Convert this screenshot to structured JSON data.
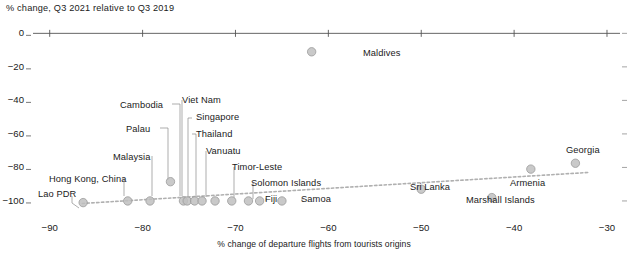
{
  "chart_data": {
    "type": "scatter",
    "title": "",
    "ylabel": "% change, Q3 2021 relative to Q3 2019",
    "xlabel": "% change of departure flights from tourists origins",
    "xlim": [
      -92,
      -28
    ],
    "ylim": [
      -106,
      2
    ],
    "xticks": [
      -90,
      -80,
      -70,
      -60,
      -50,
      -40,
      -30
    ],
    "xtick_labels": [
      "−90",
      "−80",
      "−70",
      "−60",
      "−50",
      "−40",
      "−30"
    ],
    "yticks": [
      0,
      -20,
      -40,
      -60,
      -80,
      -100
    ],
    "ytick_labels": [
      "0",
      "−20",
      "−40",
      "−60",
      "−80",
      "−100"
    ],
    "grid": false,
    "legend": null,
    "marker_color": "#c0c0c0",
    "marker_edge_color": "#9a9a9a",
    "trendline": {
      "style": "dotted",
      "color": "#b0b0b0",
      "x0": -86.5,
      "y0": -101.5,
      "x1": -32.0,
      "y1": -83.0
    },
    "points": [
      {
        "name": "Lao PDR",
        "x": -86.4,
        "y": -101.0,
        "label_x": 38,
        "label_y": 189,
        "leader": [
          [
            72,
            196
          ],
          [
            72,
            203
          ],
          [
            79,
            208
          ]
        ]
      },
      {
        "name": "Hong Kong, China",
        "x": -81.6,
        "y": -100.0,
        "label_x": 49,
        "label_y": 174,
        "leader": [
          [
            124,
            178
          ],
          [
            124,
            196
          ]
        ]
      },
      {
        "name": "Malaysia",
        "x": -79.2,
        "y": -100.0,
        "label_x": 113,
        "label_y": 152,
        "leader": [
          [
            152,
            156
          ],
          [
            152,
            196
          ]
        ]
      },
      {
        "name": "Palau",
        "x": -77.0,
        "y": -88.5,
        "label_x": 126,
        "label_y": 124,
        "leader": [
          [
            160,
            128
          ],
          [
            168,
            128
          ],
          [
            168,
            180
          ]
        ]
      },
      {
        "name": "Cambodia",
        "x": -75.6,
        "y": -100.0,
        "label_x": 120,
        "label_y": 100,
        "leader": [
          [
            172,
            104
          ],
          [
            180,
            104
          ],
          [
            180,
            196
          ]
        ]
      },
      {
        "name": "Viet Nam",
        "x": -75.2,
        "y": -100.0,
        "label_x": 182,
        "label_y": 95,
        "leader": [
          [
            182,
            100
          ],
          [
            182,
            196
          ]
        ]
      },
      {
        "name": "Singapore",
        "x": -74.4,
        "y": -100.0,
        "label_x": 196,
        "label_y": 112,
        "leader": [
          [
            192,
            118
          ],
          [
            188,
            118
          ],
          [
            188,
            196
          ]
        ]
      },
      {
        "name": "Thailand",
        "x": -73.6,
        "y": -100.0,
        "label_x": 196,
        "label_y": 129,
        "leader": [
          [
            192,
            134
          ],
          [
            196,
            134
          ],
          [
            196,
            197
          ]
        ]
      },
      {
        "name": "Vanuatu",
        "x": -72.2,
        "y": -100.0,
        "label_x": 206,
        "label_y": 146,
        "leader": [
          [
            206,
            151
          ],
          [
            206,
            197
          ]
        ]
      },
      {
        "name": "Timor-Leste",
        "x": -70.4,
        "y": -100.0,
        "label_x": 232,
        "label_y": 162,
        "leader": [
          [
            234,
            167
          ],
          [
            234,
            198
          ]
        ]
      },
      {
        "name": "Solomon Islands",
        "x": -68.6,
        "y": -100.0,
        "label_x": 251,
        "label_y": 178,
        "leader": [
          [
            253,
            183
          ],
          [
            253,
            199
          ]
        ]
      },
      {
        "name": "Fiji",
        "x": -67.4,
        "y": -100.0,
        "label_x": 265,
        "label_y": 194,
        "leader": [
          [
            266,
            198
          ],
          [
            266,
            201
          ]
        ]
      },
      {
        "name": "Samoa",
        "x": -65.0,
        "y": -100.0,
        "label_x": 301,
        "label_y": 194,
        "leader": [
          [
            302,
            198
          ],
          [
            302,
            201
          ]
        ]
      },
      {
        "name": "Maldives",
        "x": -61.8,
        "y": -11.0,
        "label_x": 363,
        "label_y": 48,
        "leader": null
      },
      {
        "name": "Sri Lanka",
        "x": -50.0,
        "y": -93.0,
        "label_x": 410,
        "label_y": 182,
        "leader": null
      },
      {
        "name": "Marshall Islands",
        "x": -42.4,
        "y": -98.0,
        "label_x": 466,
        "label_y": 195,
        "leader": null
      },
      {
        "name": "Armenia",
        "x": -38.2,
        "y": -81.0,
        "label_x": 510,
        "label_y": 178,
        "leader": null
      },
      {
        "name": "Georgia",
        "x": -33.4,
        "y": -77.5,
        "label_x": 566,
        "label_y": 145,
        "leader": null
      }
    ]
  }
}
